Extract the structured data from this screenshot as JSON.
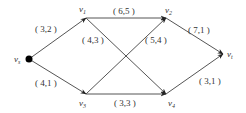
{
  "diagram": {
    "type": "network-flow",
    "nodes": [
      {
        "id": "vs",
        "label": "v",
        "sub": "s",
        "x": 29,
        "y": 59,
        "lx": 14,
        "ly": 62,
        "source": true
      },
      {
        "id": "v1",
        "label": "v",
        "sub": "1",
        "x": 86,
        "y": 18,
        "lx": 79,
        "ly": 12
      },
      {
        "id": "v2",
        "label": "v",
        "sub": "2",
        "x": 166,
        "y": 18,
        "lx": 165,
        "ly": 13
      },
      {
        "id": "v3",
        "label": "v",
        "sub": "3",
        "x": 86,
        "y": 94,
        "lx": 79,
        "ly": 106
      },
      {
        "id": "v4",
        "label": "v",
        "sub": "4",
        "x": 166,
        "y": 94,
        "lx": 168,
        "ly": 106
      },
      {
        "id": "vt",
        "label": "v",
        "sub": "t",
        "x": 223,
        "y": 54,
        "lx": 227,
        "ly": 57
      }
    ],
    "edges": [
      {
        "from": "vs",
        "to": "v1",
        "label": "( 3,2 )",
        "lx": 35,
        "ly": 32
      },
      {
        "from": "vs",
        "to": "v3",
        "label": "( 4,1 )",
        "lx": 35,
        "ly": 86
      },
      {
        "from": "v1",
        "to": "v2",
        "label": "( 6,5 )",
        "lx": 113,
        "ly": 14
      },
      {
        "from": "v1",
        "to": "v4",
        "label": "( 4,3 )",
        "lx": 82,
        "ly": 43
      },
      {
        "from": "v3",
        "to": "v2",
        "label": "( 5,4 )",
        "lx": 145,
        "ly": 43
      },
      {
        "from": "v3",
        "to": "v4",
        "label": "( 3,3 )",
        "lx": 114,
        "ly": 106
      },
      {
        "from": "v2",
        "to": "vt",
        "label": "( 7,1 )",
        "lx": 188,
        "ly": 33
      },
      {
        "from": "v4",
        "to": "vt",
        "label": "( 3,1 )",
        "lx": 199,
        "ly": 84
      }
    ]
  }
}
